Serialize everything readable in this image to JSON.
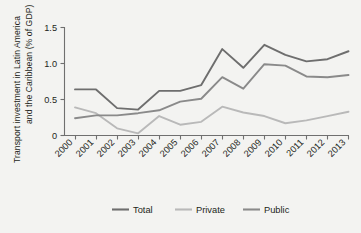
{
  "chart_data": {
    "type": "line",
    "title": "",
    "subtitle": "",
    "xlabel": "",
    "ylabel": "Transport investment in Latin America and the Caribbean (% of GDP)",
    "categories": [
      "2000",
      "2001",
      "2002",
      "2003",
      "2004",
      "2005",
      "2006",
      "2007",
      "2008",
      "2009",
      "2010",
      "2011",
      "2012",
      "2013"
    ],
    "x": [
      2000,
      2001,
      2002,
      2003,
      2004,
      2005,
      2006,
      2007,
      2008,
      2009,
      2010,
      2011,
      2012,
      2013
    ],
    "series": [
      {
        "name": "Total",
        "color": "#6e6e6e",
        "values": [
          0.64,
          0.64,
          0.38,
          0.36,
          0.62,
          0.62,
          0.7,
          1.2,
          0.94,
          1.26,
          1.12,
          1.03,
          1.06,
          1.17
        ]
      },
      {
        "name": "Private",
        "color": "#b9b9b9",
        "values": [
          0.39,
          0.31,
          0.1,
          0.03,
          0.27,
          0.15,
          0.19,
          0.4,
          0.32,
          0.27,
          0.17,
          0.21,
          0.27,
          0.33
        ]
      },
      {
        "name": "Public",
        "color": "#8a8a8a",
        "values": [
          0.24,
          0.28,
          0.28,
          0.31,
          0.35,
          0.47,
          0.51,
          0.81,
          0.65,
          0.99,
          0.97,
          0.82,
          0.81,
          0.84
        ]
      }
    ],
    "ylim": [
      0,
      1.5
    ],
    "yticks": [
      0,
      0.5,
      1.0,
      1.5
    ],
    "ytick_labels": [
      "0",
      "0.5",
      "1.0",
      "1.5"
    ],
    "xtick_rotation": 45,
    "grid": false,
    "legend_position": "bottom",
    "legend_entries": [
      "Total",
      "Private",
      "Public"
    ],
    "annotations": []
  },
  "figure": {
    "background_color": "#f3f3f1",
    "axis_color": "#6f6f6f",
    "text_color": "#231f20"
  }
}
